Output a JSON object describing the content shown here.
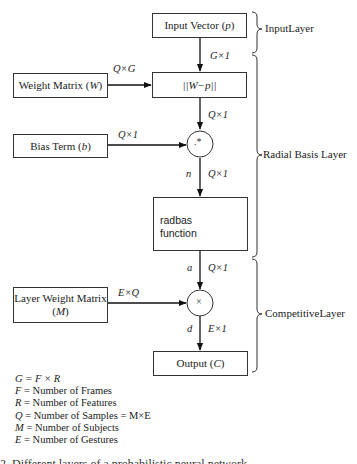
{
  "diagram": {
    "boxes": {
      "input_vector": {
        "label": "Input Vector (",
        "var": "p",
        "close": ")"
      },
      "distance": {
        "label": "||W−p||"
      },
      "weight_matrix": {
        "label": "Weight Matrix (",
        "var": "W",
        "close": ")"
      },
      "bias_term": {
        "label": "Bias Term (",
        "var": "b",
        "close": ")"
      },
      "radbas": {
        "line1": "radbas",
        "line2": "function"
      },
      "layer_weight_matrix": {
        "line1": "Layer Weight Matrix",
        "var": "M"
      },
      "output": {
        "label": "Output (",
        "var": "C",
        "close": ")"
      }
    },
    "operators": {
      "elementwise_multiply": ".*",
      "multiply": "×"
    },
    "dimension_labels": {
      "input_to_distance": "G×1",
      "weight_to_distance": "Q×G",
      "distance_to_mult": "Q×1",
      "bias_to_mult": "Q×1",
      "mult_to_radbas": "Q×1",
      "radbas_to_mult2": "Q×1",
      "lw_to_mult2": "E×Q",
      "mult2_to_output": "E×1"
    },
    "signal_labels": {
      "n": "n",
      "a": "a",
      "d": "d"
    },
    "layers": [
      {
        "name": "InputLayer"
      },
      {
        "name": "Radial Basis Layer"
      },
      {
        "name": "CompetitiveLayer"
      }
    ],
    "legend": [
      {
        "var": "G",
        "text": " = F × R"
      },
      {
        "var": "F",
        "text": " = Number of Frames"
      },
      {
        "var": "R",
        "text": " = Number of Features"
      },
      {
        "var": "Q",
        "text": " = Number of Samples = M×E"
      },
      {
        "var": "M",
        "text": " = Number of Subjects"
      },
      {
        "var": "E",
        "text": " = Number of Gestures"
      }
    ],
    "caption_partial": "2. Different layers of a probabilistic neural network"
  }
}
